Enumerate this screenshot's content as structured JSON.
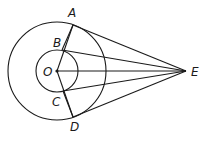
{
  "diagram": {
    "type": "geometry",
    "circles": [
      {
        "name": "outer-circle",
        "center": "O",
        "cx": 57,
        "cy": 71,
        "r": 49
      },
      {
        "name": "inner-circle",
        "center": "O",
        "cx": 57,
        "cy": 71,
        "r": 21
      }
    ],
    "points": {
      "O": {
        "label": "O",
        "x": 57,
        "y": 71
      },
      "A": {
        "label": "A",
        "x": 73,
        "y": 25
      },
      "B": {
        "label": "B",
        "x": 62,
        "y": 50
      },
      "C": {
        "label": "C",
        "x": 63,
        "y": 91
      },
      "D": {
        "label": "D",
        "x": 73,
        "y": 117
      },
      "E": {
        "label": "E",
        "x": 186,
        "y": 71
      }
    },
    "segments": [
      [
        "O",
        "A"
      ],
      [
        "O",
        "D"
      ],
      [
        "B",
        "A"
      ],
      [
        "C",
        "D"
      ],
      [
        "A",
        "E"
      ],
      [
        "B",
        "E"
      ],
      [
        "O",
        "E"
      ],
      [
        "C",
        "E"
      ],
      [
        "D",
        "E"
      ]
    ],
    "labels": {
      "A": "A",
      "B": "B",
      "C": "C",
      "D": "D",
      "E": "E",
      "O": "O"
    }
  }
}
